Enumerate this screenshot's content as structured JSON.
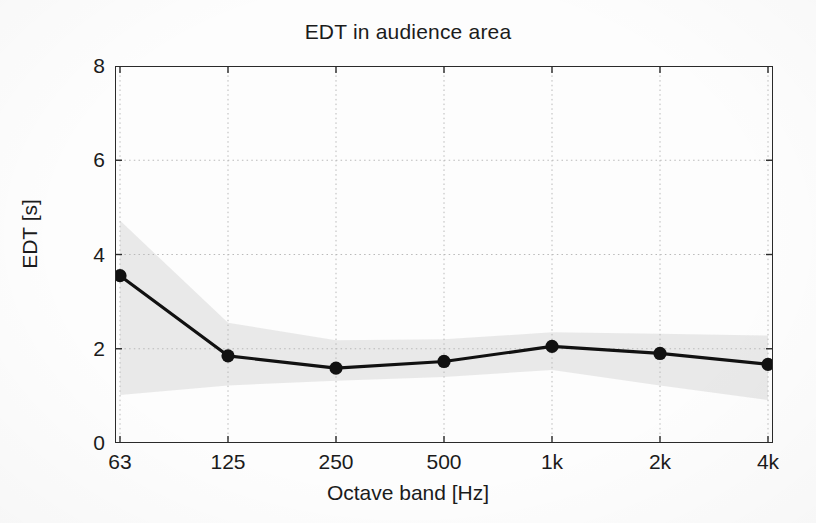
{
  "chart_data": {
    "type": "line",
    "title": "EDT in audience area",
    "xlabel": "Octave band [Hz]",
    "ylabel": "EDT [s]",
    "categories": [
      "63",
      "125",
      "250",
      "500",
      "1k",
      "2k",
      "4k"
    ],
    "series": [
      {
        "name": "EDT mean",
        "values": [
          3.55,
          1.85,
          1.59,
          1.73,
          2.05,
          1.9,
          1.67
        ],
        "marker": "filled-circle",
        "color": "#111111"
      }
    ],
    "bands": [
      {
        "name": "EDT spread (shaded)",
        "upper": [
          4.72,
          2.55,
          2.18,
          2.2,
          2.35,
          2.32,
          2.28
        ],
        "lower": [
          1.02,
          1.22,
          1.32,
          1.4,
          1.55,
          1.22,
          0.91
        ],
        "color": "#e8e8e8"
      }
    ],
    "ylim": [
      0,
      8
    ],
    "yticks": [
      0,
      2,
      4,
      6,
      8
    ],
    "ytick_labels": [
      "0",
      "2",
      "4",
      "6",
      "8"
    ],
    "grid": true,
    "grid_style": "dotted",
    "grid_color": "#b9b9b9",
    "legend": null,
    "axis_color": "#2a2a2a",
    "background": "#fdfdfd"
  },
  "figure": {
    "title": "EDT in audience area",
    "x_axis_title": "Octave band [Hz]",
    "y_axis_title": "EDT [s]"
  }
}
